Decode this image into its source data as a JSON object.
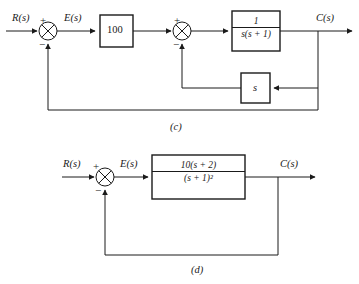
{
  "figure": {
    "diagrams": [
      {
        "caption": "(c)",
        "input_label": "R(s)",
        "error_label": "E(s)",
        "output_label": "C(s)",
        "sum1": {
          "plus": "+",
          "minus": "−"
        },
        "sum2": {
          "plus": "+",
          "minus": "−"
        },
        "gain_block": "100",
        "plant_block": {
          "numerator": "1",
          "denominator": "s(s + 1)"
        },
        "inner_feedback_block": "s"
      },
      {
        "caption": "(d)",
        "input_label": "R(s)",
        "error_label": "E(s)",
        "output_label": "C(s)",
        "sum1": {
          "plus": "+",
          "minus": "−"
        },
        "plant_block": {
          "numerator": "10(s + 2)",
          "denominator": "(s + 1)²"
        }
      }
    ]
  },
  "colors": {
    "line": "#1a1a1a",
    "background": "#ffffff"
  }
}
